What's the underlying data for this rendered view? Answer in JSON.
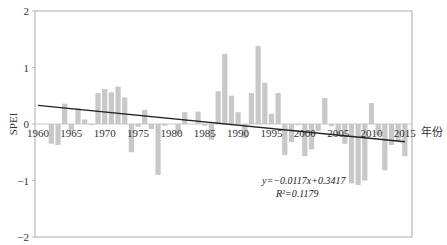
{
  "chart_data": {
    "type": "bar",
    "title": "",
    "xlabel": "年份",
    "ylabel": "SPEI",
    "ylim": [
      -2,
      2
    ],
    "xlim": [
      1960,
      2015
    ],
    "yticks": [
      2,
      1,
      0,
      -1,
      -2
    ],
    "ytick_labels": [
      "2",
      "1",
      "0",
      "−1",
      "−2"
    ],
    "xticks": [
      1960,
      1965,
      1970,
      1975,
      1980,
      1985,
      1990,
      1995,
      2000,
      2005,
      2010,
      2015
    ],
    "xtick_labels": [
      "1960",
      "1965",
      "1970",
      "1975",
      "1980",
      "1985",
      "1990",
      "1995",
      "2000",
      "2005",
      "2010",
      "2015"
    ],
    "grid": false,
    "legend": null,
    "categories": [
      1960,
      1961,
      1962,
      1963,
      1964,
      1965,
      1966,
      1967,
      1968,
      1969,
      1970,
      1971,
      1972,
      1973,
      1974,
      1975,
      1976,
      1977,
      1978,
      1979,
      1980,
      1981,
      1982,
      1983,
      1984,
      1985,
      1986,
      1987,
      1988,
      1989,
      1990,
      1991,
      1992,
      1993,
      1994,
      1995,
      1996,
      1997,
      1998,
      1999,
      2000,
      2001,
      2002,
      2003,
      2004,
      2005,
      2006,
      2007,
      2008,
      2009,
      2010,
      2011,
      2012,
      2013,
      2014,
      2015
    ],
    "series": [
      {
        "name": "SPEI",
        "type": "bar",
        "color": "#c8c8c8",
        "values": [
          0,
          0,
          -0.35,
          -0.37,
          0.36,
          -0.13,
          0.28,
          0.08,
          -0.02,
          0.55,
          0.62,
          0.56,
          0.66,
          0.47,
          -0.5,
          -0.05,
          0.25,
          -0.09,
          -0.9,
          -0.03,
          0,
          -0.18,
          0.21,
          0,
          0.22,
          -0.03,
          -0.28,
          0.58,
          1.24,
          0.5,
          0.21,
          -0.25,
          0.55,
          1.38,
          0.73,
          0.18,
          0.55,
          -0.55,
          -0.32,
          -0.02,
          -0.57,
          -0.45,
          -0.12,
          0.46,
          -0.04,
          -0.18,
          -0.35,
          -1.05,
          -1.08,
          -1.0,
          0.37,
          -0.2,
          -0.82,
          -0.37,
          -0.3,
          -0.57
        ]
      },
      {
        "name": "Linear trend",
        "type": "line",
        "color": "#222222",
        "slope": -0.0117,
        "intercept": 0.3417,
        "x_start": 1960,
        "x_end": 2015
      }
    ],
    "annotations": [
      {
        "text": "y=−0.0117x+0.3417",
        "x": 2000,
        "y": -0.9
      },
      {
        "text": "R²=0.1179",
        "x": 2000,
        "y": -1.1
      }
    ]
  },
  "equation_line1": "y=−0.0117x+0.3417",
  "equation_line2": "R²=0.1179",
  "x_axis_title": "年份",
  "y_axis_title": "SPEI"
}
